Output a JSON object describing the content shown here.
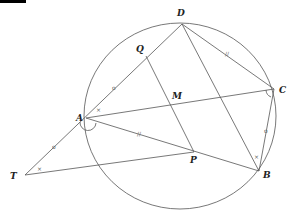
{
  "diagram": {
    "type": "geometry",
    "points": {
      "A": {
        "label": "A",
        "x": 86,
        "y": 118
      },
      "B": {
        "label": "B",
        "x": 259,
        "y": 171
      },
      "C": {
        "label": "C",
        "x": 274,
        "y": 89
      },
      "D": {
        "label": "D",
        "x": 182,
        "y": 24
      },
      "M": {
        "label": "M",
        "x": 171,
        "y": 105
      },
      "P": {
        "label": "P",
        "x": 194,
        "y": 152
      },
      "Q": {
        "label": "Q",
        "x": 146,
        "y": 56
      },
      "T": {
        "label": "T",
        "x": 25,
        "y": 175
      }
    },
    "circle": {
      "through": [
        "A",
        "B",
        "C",
        "D"
      ]
    },
    "segments": [
      "TD",
      "TP",
      "AC",
      "AB",
      "DB",
      "DC",
      "CB",
      "QP",
      "AP"
    ],
    "marks": {
      "single_tick": "o",
      "double_tick": "//",
      "angle_x": "×"
    }
  }
}
